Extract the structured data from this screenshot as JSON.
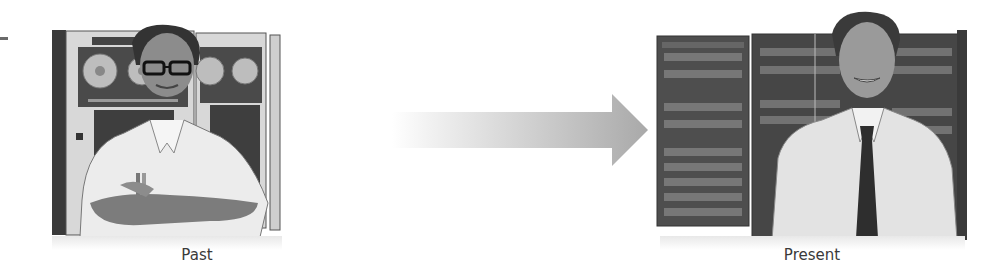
{
  "figure": {
    "past": {
      "label": "Past",
      "scene": "Mainframe tape-drive cabinets with a man in glasses and short-sleeve shirt, arms crossed",
      "icon": "mainframe-operator-illustration"
    },
    "arrow": {
      "icon": "arrow-right-icon",
      "direction": "left-to-right",
      "colors": {
        "start": "#f4f4f4",
        "end": "#a8a8a8"
      }
    },
    "present": {
      "label": "Present",
      "scene": "Modern rack servers with a man in dress shirt and tie",
      "icon": "server-admin-illustration"
    },
    "colors": {
      "background": "#ffffff",
      "label_text": "#3a3a3a",
      "cabinet_light": "#d9d9d9",
      "cabinet_dark": "#3c3c3c",
      "rack_dark": "#4a4a4a"
    }
  }
}
